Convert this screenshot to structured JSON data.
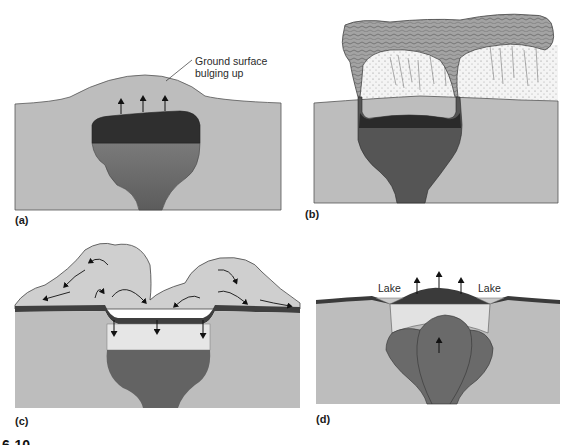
{
  "figure": {
    "number_partial": "6-10",
    "panels": [
      {
        "id": "a",
        "label": "(a)",
        "annotation_line1": "Ground surface",
        "annotation_line2": "bulging up"
      },
      {
        "id": "b",
        "label": "(b)"
      },
      {
        "id": "c",
        "label": "(c)"
      },
      {
        "id": "d",
        "label": "(d)",
        "lake_left": "Lake",
        "lake_right": "Lake"
      }
    ]
  },
  "colors": {
    "ground": "#bdbdbd",
    "ground_edge": "#555555",
    "magma_dark": "#2e2e2e",
    "magma_mid": "#6d6d6d",
    "magma_light": "#d9d9d9",
    "ash_cloud": "#9a9a9a",
    "ash_fall": "#efefef",
    "crust": "#4a4a4a"
  }
}
